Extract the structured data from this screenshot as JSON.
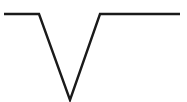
{
  "figure": {
    "name": "v-shaped-polyline",
    "background_color": "#ffffff",
    "width": 187,
    "height": 102,
    "stroke_color": "#1a1a1a",
    "stroke_width": 2.4,
    "stroke_linejoin": "miter",
    "stroke_linecap": "butt",
    "points": "4,14 39,14 70,100 100,14 180,14"
  },
  "chart_data": {
    "type": "line",
    "title": "",
    "subtitle": "",
    "xlabel": "",
    "ylabel": "",
    "grid": false,
    "legend": null,
    "axis_visible": false,
    "tick_labels_x": [],
    "tick_labels_y": [],
    "xlim": [
      0,
      187
    ],
    "ylim": [
      0,
      102
    ],
    "series": [
      {
        "name": "v-notch",
        "color": "#1a1a1a",
        "x": [
          4,
          39,
          70,
          100,
          180
        ],
        "y": [
          14,
          14,
          100,
          14,
          14
        ]
      }
    ],
    "annotations": []
  }
}
